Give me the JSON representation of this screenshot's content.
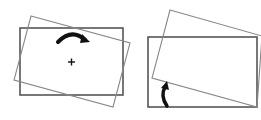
{
  "diagram": {
    "colors": {
      "background": "#ffffff",
      "original_rect": "#555555",
      "rotated_rect": "#888888",
      "arrow": "#111111"
    },
    "panels": [
      {
        "name": "rotate-about-center",
        "original_rect": {
          "x": 20,
          "y": 28,
          "w": 103,
          "h": 67
        },
        "rotated_rect_points": "31,16 130,43 113,107 14,80",
        "pivot": {
          "x": 71,
          "y": 62,
          "marker": "+"
        },
        "arrow": "curved clockwise arrow above pivot"
      },
      {
        "name": "rotate-about-corner",
        "original_rect": {
          "x": 148,
          "y": 37,
          "w": 109,
          "h": 70
        },
        "rotated_rect_points": "170,10 262,36 257,107 152,78",
        "pivot": {
          "x": 257,
          "y": 107
        },
        "arrow": "curved arrow at lower-left pointing up"
      }
    ]
  }
}
